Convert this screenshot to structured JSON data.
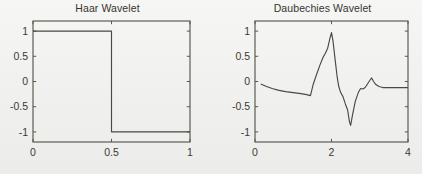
{
  "figure": {
    "background_color": "#f2f2f0",
    "axis_color": "#58584f",
    "line_color": "#4a4a44"
  },
  "panels": [
    {
      "id": "haar",
      "title": "Haar Wavelet"
    },
    {
      "id": "daubechies",
      "title": "Daubechies Wavelet"
    }
  ],
  "chart_data": [
    {
      "type": "line",
      "title": "Haar Wavelet",
      "xlabel": "",
      "ylabel": "",
      "xlim": [
        0,
        1
      ],
      "ylim": [
        -1.2,
        1.2
      ],
      "xticks": [
        0,
        0.5,
        1
      ],
      "xticklabels": [
        "0",
        "0.5",
        "1"
      ],
      "yticks": [
        -1,
        -0.5,
        0,
        0.5,
        1
      ],
      "yticklabels": [
        "-1",
        "-0.5",
        "0",
        "0.5",
        "1"
      ],
      "grid": false,
      "legend": false,
      "series": [
        {
          "name": "haar",
          "x": [
            0,
            0.5,
            0.5,
            1
          ],
          "y": [
            1,
            1,
            -1,
            -1
          ]
        }
      ]
    },
    {
      "type": "line",
      "title": "Daubechies Wavelet",
      "xlabel": "",
      "ylabel": "",
      "xlim": [
        0,
        4
      ],
      "ylim": [
        -1.2,
        1.2
      ],
      "xticks": [
        0,
        2,
        4
      ],
      "xticklabels": [
        "0",
        "2",
        "4"
      ],
      "yticks": [
        -1,
        -0.5,
        0,
        0.5,
        1
      ],
      "yticklabels": [
        "-1",
        "-0.5",
        "0",
        "0.5",
        "1"
      ],
      "grid": false,
      "legend": false,
      "series": [
        {
          "name": "daubechies",
          "x": [
            0.15,
            0.3,
            0.45,
            0.6,
            0.8,
            1.0,
            1.2,
            1.35,
            1.45,
            1.45,
            1.52,
            1.6,
            1.7,
            1.78,
            1.84,
            1.9,
            1.96,
            2.0,
            2.04,
            2.1,
            2.15,
            2.19,
            2.24,
            2.3,
            2.36,
            2.42,
            2.47,
            2.5,
            2.55,
            2.62,
            2.7,
            2.76,
            2.82,
            2.88,
            2.94,
            3.0,
            3.05,
            3.1,
            3.16,
            3.24,
            3.34,
            3.5,
            3.7,
            3.9,
            4.0
          ],
          "y": [
            -0.05,
            -0.1,
            -0.14,
            -0.17,
            -0.2,
            -0.22,
            -0.24,
            -0.26,
            -0.28,
            -0.28,
            -0.06,
            0.12,
            0.33,
            0.48,
            0.56,
            0.66,
            0.86,
            0.97,
            0.8,
            0.4,
            0.08,
            -0.1,
            -0.22,
            -0.3,
            -0.44,
            -0.56,
            -0.8,
            -0.87,
            -0.66,
            -0.4,
            -0.22,
            -0.14,
            -0.15,
            -0.12,
            -0.05,
            0.02,
            0.07,
            0.0,
            -0.06,
            -0.1,
            -0.12,
            -0.12,
            -0.12,
            -0.12,
            -0.12
          ]
        }
      ]
    }
  ]
}
